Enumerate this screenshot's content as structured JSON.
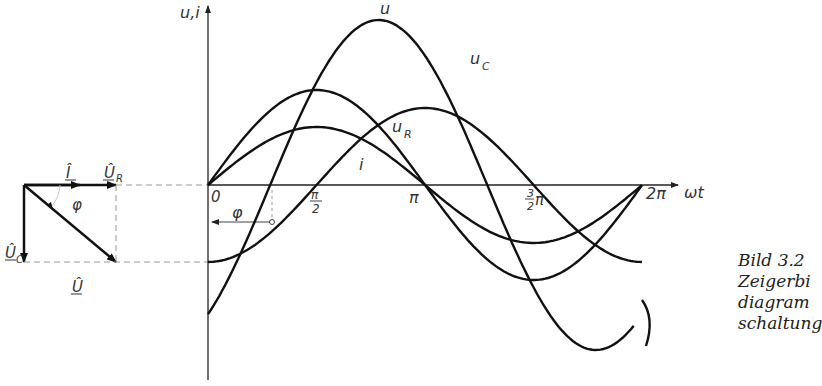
{
  "axes": {
    "y_label": "u,i",
    "x_label": "ωt",
    "origin_label": "0",
    "ticks": [
      {
        "label": "π/2",
        "num": "π",
        "den": "2"
      },
      {
        "label": "π"
      },
      {
        "label": "3/2 π",
        "num": "3",
        "den": "2",
        "suffix": "π"
      },
      {
        "label": "2π"
      }
    ],
    "phase_label": "φ"
  },
  "curves": {
    "u": "u",
    "u_c": "u",
    "u_c_sub": "C",
    "u_r": "u",
    "u_r_sub": "R",
    "i": "i"
  },
  "phasor": {
    "i_label": "Î",
    "u_r_label": "Û",
    "u_r_sub": "R",
    "u_label": "Û",
    "u_c_label": "Û",
    "u_c_sub": "C",
    "phi_label": "φ"
  },
  "caption": {
    "line1": "Bild 3.2",
    "line2": "Zeigerbi",
    "line3": "diagram",
    "line4": "schaltung"
  },
  "chart_data": {
    "type": "line",
    "xlabel": "ωt",
    "ylabel": "u,i",
    "x_ticks": [
      "0",
      "π/2",
      "π",
      "3/2 π",
      "2π"
    ],
    "series": [
      {
        "name": "u",
        "amplitude": 1.0,
        "phase_deg": -48
      },
      {
        "name": "u_C",
        "amplitude": 0.47,
        "phase_deg": -90
      },
      {
        "name": "u_R",
        "amplitude": 0.58,
        "phase_deg": 0
      },
      {
        "name": "i",
        "amplitude": 0.35,
        "phase_deg": 0
      }
    ],
    "annotations": [
      "φ = phase angle between u and i"
    ]
  }
}
